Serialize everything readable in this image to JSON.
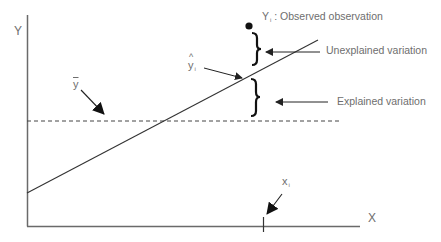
{
  "diagram": {
    "axes": {
      "y_label": "Y",
      "x_label": "X"
    },
    "symbols": {
      "y_bar": "y",
      "y_hat": "y",
      "y_hat_sub": "i",
      "x_i": "x",
      "x_i_sub": "i",
      "y_i": "Y",
      "y_i_sub": "i"
    },
    "annotations": {
      "observed": ": Observed observation",
      "unexplained": "Unexplained variation",
      "explained": "Explained variation"
    },
    "colors": {
      "line": "#333333",
      "text": "#6e6e6e",
      "axis": "#6a6a6a"
    },
    "elements": [
      "y-axis",
      "x-axis",
      "regression-line",
      "mean-line-dashed",
      "observed-point",
      "unexplained-brace",
      "explained-brace",
      "x-i-tick"
    ]
  }
}
